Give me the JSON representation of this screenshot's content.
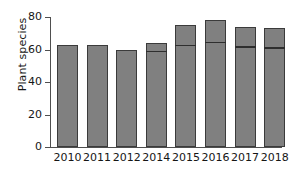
{
  "chart_data": {
    "type": "bar",
    "title": "",
    "subtitle": "",
    "xlabel": "",
    "ylabel": "Plant species",
    "categories": [
      "2010",
      "2011",
      "2012",
      "2014",
      "2015",
      "2016",
      "2017",
      "2018"
    ],
    "values": [
      63,
      63,
      60,
      64,
      75,
      78,
      74,
      73
    ],
    "segment_markers": [
      null,
      null,
      null,
      58.5,
      62,
      64,
      61,
      60.5
    ],
    "ylim": [
      0,
      80
    ],
    "yticks": [
      0,
      20,
      40,
      60,
      80
    ],
    "ytick_labels": [
      "0",
      "20",
      "40",
      "60",
      "80"
    ],
    "grid": false,
    "legend": false,
    "legend_position": "none",
    "series": [
      {
        "name": "Plant species",
        "values": [
          63,
          63,
          60,
          64,
          75,
          78,
          74,
          73
        ]
      }
    ],
    "colors": {
      "bar_fill": "#808080",
      "bar_edge": "#3b3b3b",
      "divider": "#2e2e2e",
      "axis": "#4f4f4f",
      "text": "#161616",
      "background": "#ffffff"
    },
    "annotations": []
  }
}
